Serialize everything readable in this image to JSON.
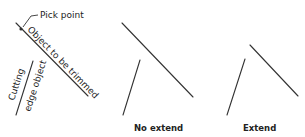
{
  "left_panel": {
    "pick_point_label": "Pick point",
    "object_label": "Object to be trimmed",
    "cutting_label_line1": "Cutting",
    "cutting_label_line2": "edge object"
  },
  "middle_panel": {
    "caption": "No extend"
  },
  "right_panel": {
    "caption": "Extend"
  },
  "colors": {
    "line": "#333333",
    "text": "#222222",
    "background": "#ffffff"
  }
}
